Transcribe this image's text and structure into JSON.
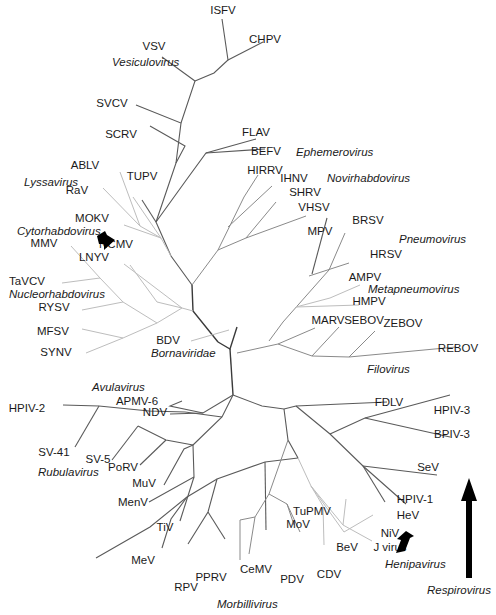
{
  "diagram": {
    "title": "",
    "type": "unrooted phylogenetic tree",
    "colors": {
      "branch_dark": "#5a5a5a",
      "branch_mid": "#8a8a8a",
      "branch_light": "#bdbdbd",
      "text": "#1a1a1a",
      "arrow": "#000000"
    },
    "taxa": [
      {
        "id": "ISFV",
        "label": "ISFV",
        "x": 223,
        "y": 14
      },
      {
        "id": "CHPV",
        "label": "CHPV",
        "x": 265,
        "y": 43
      },
      {
        "id": "VSV",
        "label": "VSV",
        "x": 154,
        "y": 50
      },
      {
        "id": "SVCV",
        "label": "SVCV",
        "x": 112,
        "y": 107
      },
      {
        "id": "SCRV",
        "label": "SCRV",
        "x": 121,
        "y": 138
      },
      {
        "id": "FLAV",
        "label": "FLAV",
        "x": 256,
        "y": 136
      },
      {
        "id": "BEFV",
        "label": "BEFV",
        "x": 266,
        "y": 155
      },
      {
        "id": "ABLV",
        "label": "ABLV",
        "x": 85,
        "y": 169
      },
      {
        "id": "TUPV",
        "label": "TUPV",
        "x": 142,
        "y": 180
      },
      {
        "id": "HIRRV",
        "label": "HIRRV",
        "x": 265,
        "y": 174
      },
      {
        "id": "IHNV",
        "label": "IHNV",
        "x": 294,
        "y": 182
      },
      {
        "id": "RaV",
        "label": "RaV",
        "x": 77,
        "y": 194
      },
      {
        "id": "SHRV",
        "label": "SHRV",
        "x": 305,
        "y": 196
      },
      {
        "id": "VHSV",
        "label": "VHSV",
        "x": 314,
        "y": 211
      },
      {
        "id": "BRSV",
        "label": "BRSV",
        "x": 368,
        "y": 224
      },
      {
        "id": "MOKV",
        "label": "MOKV",
        "x": 92,
        "y": 222
      },
      {
        "id": "MPV",
        "label": "MPV",
        "x": 320,
        "y": 235
      },
      {
        "id": "NCMV",
        "label": "NCMV",
        "x": 116,
        "y": 248
      },
      {
        "id": "MMV",
        "label": "MMV",
        "x": 44,
        "y": 247
      },
      {
        "id": "LNYV",
        "label": "LNYV",
        "x": 94,
        "y": 261
      },
      {
        "id": "HRSV",
        "label": "HRSV",
        "x": 386,
        "y": 258
      },
      {
        "id": "AMPV",
        "label": "AMPV",
        "x": 365,
        "y": 281
      },
      {
        "id": "TaVCV",
        "label": "TaVCV",
        "x": 27,
        "y": 285
      },
      {
        "id": "HMPV",
        "label": "HMPV",
        "x": 369,
        "y": 305
      },
      {
        "id": "RYSV",
        "label": "RYSV",
        "x": 54,
        "y": 311
      },
      {
        "id": "MARV",
        "label": "MARV",
        "x": 328,
        "y": 324
      },
      {
        "id": "SEBOV",
        "label": "SEBOV",
        "x": 364,
        "y": 324
      },
      {
        "id": "ZEBOV",
        "label": "ZEBOV",
        "x": 403,
        "y": 327
      },
      {
        "id": "MFSV",
        "label": "MFSV",
        "x": 53,
        "y": 335
      },
      {
        "id": "REBOV",
        "label": "REBOV",
        "x": 458,
        "y": 352
      },
      {
        "id": "BDV",
        "label": "BDV",
        "x": 168,
        "y": 344
      },
      {
        "id": "SYNV",
        "label": "SYNV",
        "x": 56,
        "y": 356
      },
      {
        "id": "APMV-6",
        "label": "APMV-6",
        "x": 137,
        "y": 405
      },
      {
        "id": "NDV",
        "label": "NDV",
        "x": 155,
        "y": 416
      },
      {
        "id": "HPIV-2",
        "label": "HPIV-2",
        "x": 27,
        "y": 412
      },
      {
        "id": "FDLV",
        "label": "FDLV",
        "x": 389,
        "y": 406
      },
      {
        "id": "HPIV-3",
        "label": "HPIV-3",
        "x": 452,
        "y": 414
      },
      {
        "id": "BPIV-3",
        "label": "BPIV-3",
        "x": 452,
        "y": 438
      },
      {
        "id": "SV-41",
        "label": "SV-41",
        "x": 54,
        "y": 456
      },
      {
        "id": "SV-5",
        "label": "SV-5",
        "x": 98,
        "y": 463
      },
      {
        "id": "PoRV",
        "label": "PoRV",
        "x": 123,
        "y": 471
      },
      {
        "id": "SeV",
        "label": "SeV",
        "x": 428,
        "y": 471
      },
      {
        "id": "MuV",
        "label": "MuV",
        "x": 144,
        "y": 487
      },
      {
        "id": "HPIV-1",
        "label": "HPIV-1",
        "x": 415,
        "y": 503
      },
      {
        "id": "MenV",
        "label": "MenV",
        "x": 133,
        "y": 506
      },
      {
        "id": "TuPMV",
        "label": "TuPMV",
        "x": 312,
        "y": 515
      },
      {
        "id": "HeV",
        "label": "HeV",
        "x": 408,
        "y": 519
      },
      {
        "id": "TiV",
        "label": "TiV",
        "x": 165,
        "y": 531
      },
      {
        "id": "MoV",
        "label": "MoV",
        "x": 298,
        "y": 528
      },
      {
        "id": "NiV",
        "label": "NiV",
        "x": 390,
        "y": 537
      },
      {
        "id": "BeV",
        "label": "BeV",
        "x": 347,
        "y": 551
      },
      {
        "id": "J virus",
        "label": "J virus",
        "x": 390,
        "y": 551
      },
      {
        "id": "MeV",
        "label": "MeV",
        "x": 143,
        "y": 564
      },
      {
        "id": "CeMV",
        "label": "CeMV",
        "x": 256,
        "y": 573
      },
      {
        "id": "PPRV",
        "label": "PPRV",
        "x": 211,
        "y": 581
      },
      {
        "id": "CDV",
        "label": "CDV",
        "x": 329,
        "y": 578
      },
      {
        "id": "PDV",
        "label": "PDV",
        "x": 292,
        "y": 583
      },
      {
        "id": "RPV",
        "label": "RPV",
        "x": 186,
        "y": 591
      }
    ],
    "genera": [
      {
        "id": "vesiculovirus",
        "label": "Vesiculovirus",
        "x": 112,
        "y": 66
      },
      {
        "id": "ephemerovirus",
        "label": "Ephemerovirus",
        "x": 296,
        "y": 156
      },
      {
        "id": "novirhabdovirus",
        "label": "Novirhabdovirus",
        "x": 327,
        "y": 182
      },
      {
        "id": "lyssavirus",
        "label": "Lyssavirus",
        "x": 24,
        "y": 186
      },
      {
        "id": "cytorhabdovirus",
        "label": "Cytorhabdovirus",
        "x": 17,
        "y": 235
      },
      {
        "id": "pneumovirus",
        "label": "Pneumovirus",
        "x": 399,
        "y": 243
      },
      {
        "id": "metapneumovirus",
        "label": "Metapneumovirus",
        "x": 368,
        "y": 293
      },
      {
        "id": "nucleorhabdovirus",
        "label": "Nucleorhabdovirus",
        "x": 9,
        "y": 298
      },
      {
        "id": "filovirus",
        "label": "Filovirus",
        "x": 367,
        "y": 373
      },
      {
        "id": "bornaviridae",
        "label": "Bornaviridae",
        "x": 151,
        "y": 357
      },
      {
        "id": "avulavirus",
        "label": "Avulavirus",
        "x": 92,
        "y": 391
      },
      {
        "id": "rubulavirus",
        "label": "Rubulavirus",
        "x": 38,
        "y": 476
      },
      {
        "id": "henipavirus",
        "label": "Henipavirus",
        "x": 385,
        "y": 568
      },
      {
        "id": "respirovirus",
        "label": "Respirovirus",
        "x": 427,
        "y": 594
      },
      {
        "id": "morbillivirus",
        "label": "Morbillivirus",
        "x": 217,
        "y": 608
      }
    ],
    "arrows": [
      {
        "id": "cytorhabdovirus-arrow",
        "points_to": "NCMV"
      },
      {
        "id": "henipavirus-arrow",
        "points_to": "NiV"
      },
      {
        "id": "respirovirus-arrow",
        "points_to": "SeV"
      }
    ],
    "branches": [
      {
        "c": "root",
        "d": "M218,342 L230,349 L237,327"
      },
      {
        "c": "root",
        "d": "M230,349 L233,395"
      },
      {
        "c": "root",
        "d": "M218,342 L193,311 L192,285"
      },
      {
        "c": "dark",
        "d": "M192,285 L171,256 L156,222 L187,179"
      },
      {
        "c": "dark",
        "d": "M187,179 L206,153 L256,139"
      },
      {
        "c": "dark",
        "d": "M206,153 L265,149"
      },
      {
        "c": "dark",
        "d": "M156,222 L142,200"
      },
      {
        "c": "dark",
        "d": "M156,222 L176,163 L185,146 L150,126"
      },
      {
        "c": "dark",
        "d": "M176,163 L181,123 L136,105"
      },
      {
        "c": "dark",
        "d": "M181,123 L195,81 L162,57"
      },
      {
        "c": "dark",
        "d": "M195,81 L214,73 L228,60 L222,19"
      },
      {
        "c": "dark",
        "d": "M228,60 L263,42"
      },
      {
        "c": "light",
        "d": "M171,256 L161,238 L133,197"
      },
      {
        "c": "light",
        "d": "M161,238 L140,226 L120,172"
      },
      {
        "c": "light",
        "d": "M140,226 L103,188"
      },
      {
        "c": "light",
        "d": "M161,238 L124,225"
      },
      {
        "c": "light",
        "d": "M193,311 L182,308 L124,264"
      },
      {
        "c": "light",
        "d": "M182,308 L157,302 L130,265"
      },
      {
        "c": "light",
        "d": "M182,308 L157,323 L123,302 L100,278 L71,246"
      },
      {
        "c": "light",
        "d": "M100,278 L62,283"
      },
      {
        "c": "light",
        "d": "M123,302 L82,310"
      },
      {
        "c": "light",
        "d": "M157,323 L123,338 L82,329"
      },
      {
        "c": "light",
        "d": "M123,338 L86,353"
      },
      {
        "c": "light",
        "d": "M229,330 L191,341"
      },
      {
        "c": "mid",
        "d": "M192,285 L218,250 L244,197 L258,175"
      },
      {
        "c": "mid",
        "d": "M228,227 L272,186"
      },
      {
        "c": "mid",
        "d": "M218,250 L246,238 L276,202"
      },
      {
        "c": "mid",
        "d": "M246,238 L306,216"
      },
      {
        "c": "mid",
        "d": "M269,341 L283,322 L329,270 L345,233"
      },
      {
        "c": "mid",
        "d": "M309,276 L349,263"
      },
      {
        "c": "dark",
        "d": "M312,274 L327,218"
      },
      {
        "c": "light",
        "d": "M296,307 L330,298 L360,285"
      },
      {
        "c": "light",
        "d": "M296,307 L359,305"
      },
      {
        "c": "mid",
        "d": "M237,353 L278,344 L312,356 L349,357"
      },
      {
        "c": "mid",
        "d": "M278,344 L315,328"
      },
      {
        "c": "mid",
        "d": "M312,356 L339,327"
      },
      {
        "c": "mid",
        "d": "M349,357 L375,331"
      },
      {
        "c": "mid",
        "d": "M349,357 L456,347"
      },
      {
        "c": "dark",
        "d": "M233,395 L262,406 L284,409 L296,406 L387,402"
      },
      {
        "c": "dark",
        "d": "M296,406 L330,434 L363,466 L406,504"
      },
      {
        "c": "dark",
        "d": "M330,434 L365,418 L450,395"
      },
      {
        "c": "dark",
        "d": "M365,418 L450,437"
      },
      {
        "c": "dark",
        "d": "M363,466 L437,475"
      },
      {
        "c": "dark",
        "d": "M363,466 L385,502"
      },
      {
        "c": "dark",
        "d": "M284,409 L288,440 L298,458"
      },
      {
        "c": "dark",
        "d": "M298,458 L265,462 L217,479 L187,497 L150,527 L96,558"
      },
      {
        "c": "dark",
        "d": "M265,462 L266,530"
      },
      {
        "c": "dark",
        "d": "M217,479 L208,512 L188,544"
      },
      {
        "c": "dark",
        "d": "M187,497 L171,519 L162,548"
      },
      {
        "c": "dark",
        "d": "M208,512 L225,539"
      },
      {
        "c": "mid",
        "d": "M288,440 L269,494 L255,517 L249,554"
      },
      {
        "c": "mid",
        "d": "M269,494 L287,504 L300,532"
      },
      {
        "c": "mid",
        "d": "M255,517 L240,520 L240,560"
      },
      {
        "c": "mid",
        "d": "M287,504 L294,525"
      },
      {
        "c": "light",
        "d": "M298,458 L311,486 L323,506 L324,545"
      },
      {
        "c": "light",
        "d": "M311,486 L343,525 L372,541"
      },
      {
        "c": "light",
        "d": "M311,486 L344,532 L373,515"
      },
      {
        "c": "light",
        "d": "M343,525 L346,499"
      },
      {
        "c": "dark",
        "d": "M233,395 L203,413 L170,406 L182,401"
      },
      {
        "c": "dark",
        "d": "M203,413 L170,414"
      },
      {
        "c": "dark",
        "d": "M233,395 L222,417 L193,445"
      },
      {
        "c": "dark",
        "d": "M222,417 L185,412 L149,411 L99,406 L63,405"
      },
      {
        "c": "dark",
        "d": "M99,406 L75,447"
      },
      {
        "c": "dark",
        "d": "M138,426 L112,460"
      },
      {
        "c": "dark",
        "d": "M193,445 L166,440 L138,426"
      },
      {
        "c": "dark",
        "d": "M166,440 L140,465"
      },
      {
        "c": "dark",
        "d": "M193,445 L184,449 L164,485"
      },
      {
        "c": "dark",
        "d": "M193,445 L194,477 L149,502"
      },
      {
        "c": "dark",
        "d": "M194,477 L180,521"
      }
    ]
  }
}
